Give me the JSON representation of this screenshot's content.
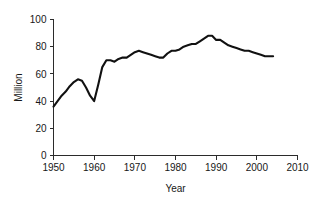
{
  "chart_data": {
    "type": "line",
    "title": "",
    "subtitle": "",
    "xlabel": "Year",
    "ylabel": "Million",
    "xlim": [
      1950,
      2010
    ],
    "ylim": [
      0,
      100
    ],
    "xticks": [
      1950,
      1960,
      1970,
      1980,
      1990,
      2000,
      2010
    ],
    "xtick_labels": [
      "1950",
      "1960",
      "1970",
      "1980",
      "1990",
      "2000",
      "2010"
    ],
    "yticks": [
      0,
      20,
      40,
      60,
      80,
      100
    ],
    "ytick_labels": [
      "0",
      "20",
      "40",
      "60",
      "80",
      "100"
    ],
    "grid": false,
    "legend": null,
    "legend_position": "none",
    "line_color": "#111111",
    "axis_color": "#2b2b2b",
    "series": [
      {
        "name": "Million",
        "x": [
          1950,
          1951,
          1952,
          1953,
          1954,
          1955,
          1956,
          1957,
          1958,
          1959,
          1960,
          1961,
          1962,
          1963,
          1964,
          1965,
          1966,
          1967,
          1968,
          1969,
          1970,
          1971,
          1972,
          1973,
          1974,
          1975,
          1976,
          1977,
          1978,
          1979,
          1980,
          1981,
          1982,
          1983,
          1984,
          1985,
          1986,
          1987,
          1988,
          1989,
          1990,
          1991,
          1992,
          1993,
          1994,
          1995,
          1996,
          1997,
          1998,
          1999,
          2000,
          2001,
          2002,
          2003,
          2004
        ],
        "values": [
          36,
          40,
          44,
          47,
          51,
          54,
          56,
          55,
          50,
          44,
          40,
          52,
          65,
          70,
          70,
          69,
          71,
          72,
          72,
          74,
          76,
          77,
          76,
          75,
          74,
          73,
          72,
          72,
          75,
          77,
          77,
          78,
          80,
          81,
          82,
          82,
          84,
          86,
          88,
          88,
          85,
          85,
          83,
          81,
          80,
          79,
          78,
          77,
          77,
          76,
          75,
          74,
          73,
          73,
          73
        ]
      }
    ]
  }
}
